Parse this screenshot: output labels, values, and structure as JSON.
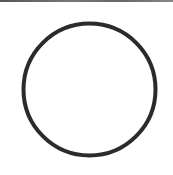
{
  "shape": {
    "type": "circle",
    "icon": "circle-outline-icon",
    "cx": 89.5,
    "cy": 89.5,
    "r": 66,
    "stroke_width": 4,
    "stroke_color": "#2b2b2b",
    "fill_color": "#ffffff"
  },
  "colors": {
    "background": "#ffffff",
    "top_strip": "#666666"
  }
}
